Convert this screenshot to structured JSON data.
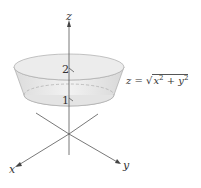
{
  "diagram": {
    "axes": {
      "z_label": "z",
      "x_label": "x",
      "y_label": "y"
    },
    "ticks": {
      "z1": "1",
      "z2": "2"
    },
    "equation": {
      "lhs": "z = ",
      "radicand_x": "x",
      "exp_x": "2",
      "plus": " + ",
      "radicand_y": "y",
      "exp_y": "2"
    },
    "colors": {
      "surface": "#e6e6e6",
      "axis": "#444444",
      "outline": "#999999"
    }
  }
}
